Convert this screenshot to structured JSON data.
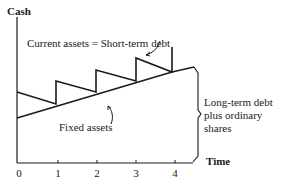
{
  "diagram": {
    "y_axis_label": "Cash",
    "x_axis_label": "Time",
    "x_ticks": [
      "0",
      "1",
      "2",
      "3",
      "4"
    ],
    "annotations": {
      "current_assets": "Current assets = Short-term debt",
      "fixed_assets": "Fixed assets",
      "long_term": "Long-term debt\nplus ordinary\nshares"
    },
    "colors": {
      "line": "#1a1a1a",
      "background": "#ffffff"
    }
  }
}
